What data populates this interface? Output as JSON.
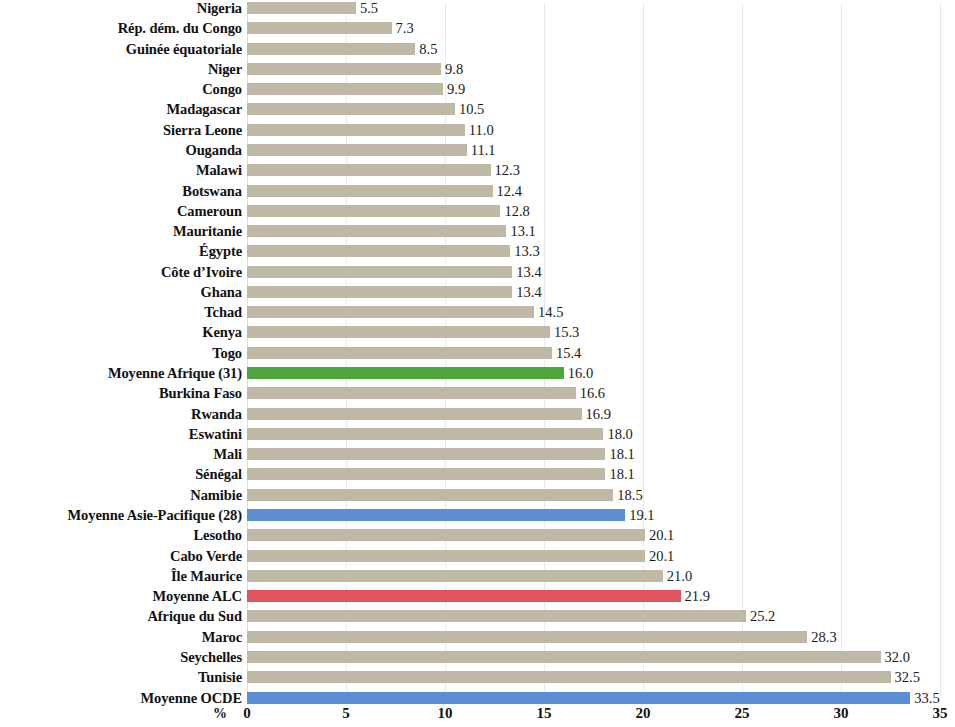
{
  "chart_data": {
    "type": "bar",
    "orientation": "horizontal",
    "title": "",
    "xlabel": "%",
    "ylabel": "",
    "xlim": [
      0,
      35
    ],
    "xticks": [
      0,
      5,
      10,
      15,
      20,
      25,
      30,
      35
    ],
    "xtick_labels": [
      "0",
      "5",
      "10",
      "15",
      "20",
      "25",
      "30",
      "35"
    ],
    "grid": true,
    "legend": "none",
    "colors": {
      "default": "#bfb8a5",
      "africa_average": "#4ca63c",
      "asia_pacific_average": "#5b8fd4",
      "alc_average": "#e0555f",
      "ocde_average": "#5b8fd4"
    },
    "categories": [
      "Nigeria",
      "Rép. dém. du Congo",
      "Guinée équatoriale",
      "Niger",
      "Congo",
      "Madagascar",
      "Sierra Leone",
      "Ouganda",
      "Malawi",
      "Botswana",
      "Cameroun",
      "Mauritanie",
      "Égypte",
      "Côte d’Ivoire",
      "Ghana",
      "Tchad",
      "Kenya",
      "Togo",
      "Moyenne Afrique (31)",
      "Burkina Faso",
      "Rwanda",
      "Eswatini",
      "Mali",
      "Sénégal",
      "Namibie",
      "Moyenne Asie-Pacifique (28)",
      "Lesotho",
      "Cabo Verde",
      "Île Maurice",
      "Moyenne ALC",
      "Afrique du Sud",
      "Maroc",
      "Seychelles",
      "Tunisie",
      "Moyenne OCDE"
    ],
    "values": [
      5.5,
      7.3,
      8.5,
      9.8,
      9.9,
      10.5,
      11.0,
      11.1,
      12.3,
      12.4,
      12.8,
      13.1,
      13.3,
      13.4,
      13.4,
      14.5,
      15.3,
      15.4,
      16.0,
      16.6,
      16.9,
      18.0,
      18.1,
      18.1,
      18.5,
      19.1,
      20.1,
      20.1,
      21.0,
      21.9,
      25.2,
      28.3,
      32.0,
      32.5,
      33.5
    ],
    "value_labels": [
      "5.5",
      "7.3",
      "8.5",
      "9.8",
      "9.9",
      "10.5",
      "11.0",
      "11.1",
      "12.3",
      "12.4",
      "12.8",
      "13.1",
      "13.3",
      "13.4",
      "13.4",
      "14.5",
      "15.3",
      "15.4",
      "16.0",
      "16.6",
      "16.9",
      "18.0",
      "18.1",
      "18.1",
      "18.5",
      "19.1",
      "20.1",
      "20.1",
      "21.0",
      "21.9",
      "25.2",
      "28.3",
      "32.0",
      "32.5",
      "33.5"
    ],
    "bar_kinds": [
      "default",
      "default",
      "default",
      "default",
      "default",
      "default",
      "default",
      "default",
      "default",
      "default",
      "default",
      "default",
      "default",
      "default",
      "default",
      "default",
      "default",
      "default",
      "africa",
      "default",
      "default",
      "default",
      "default",
      "default",
      "default",
      "asiapac",
      "default",
      "default",
      "default",
      "alc",
      "default",
      "default",
      "default",
      "default",
      "ocde"
    ]
  }
}
